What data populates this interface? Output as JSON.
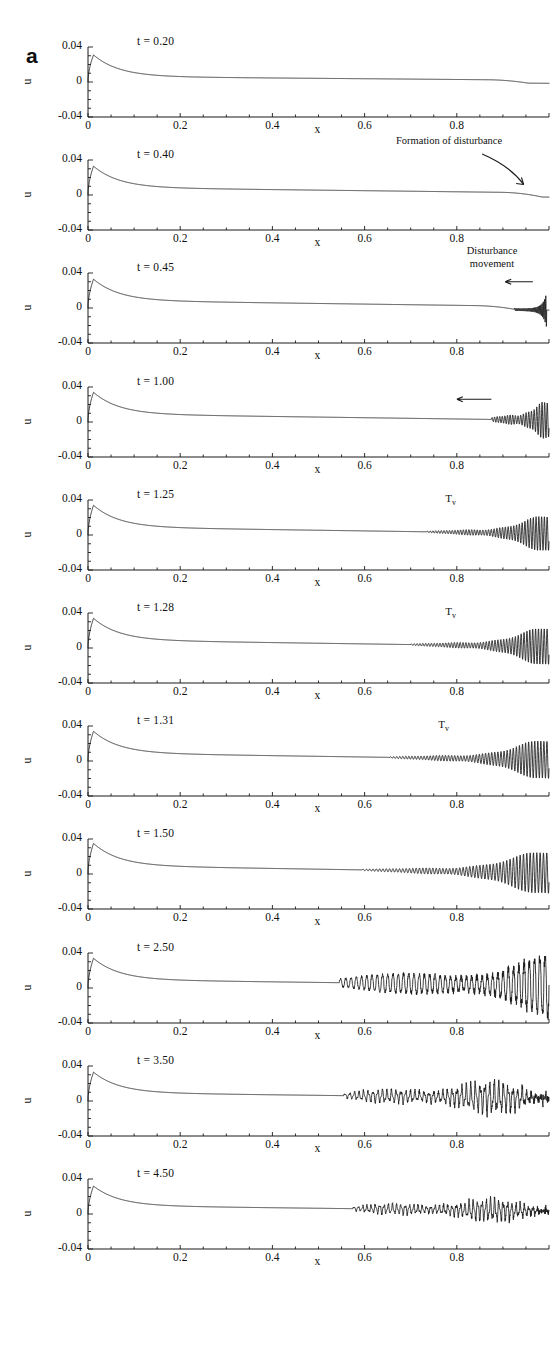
{
  "figure": {
    "panel_letter": "a",
    "y_axis_name": "u",
    "x_axis_name": "x",
    "y_ticks": [
      "0.04",
      "0",
      "-0.04"
    ],
    "x_ticks": [
      "0",
      "0.2",
      "0.4",
      "0.6",
      "0.8"
    ],
    "ink_color": "#1a1a1a",
    "background_color": "#ffffff"
  },
  "annotations": {
    "formation": "Formation of disturbance",
    "movement_line1": "Disturbance",
    "movement_line2": "movement",
    "tv_symbol": "T",
    "tv_subscript": "v"
  },
  "chart_data": {
    "type": "line",
    "title": "a",
    "xlabel": "x",
    "ylabel": "u",
    "xlim": [
      0,
      1
    ],
    "ylim": [
      -0.04,
      0.04
    ],
    "xticks": [
      0,
      0.2,
      0.4,
      0.6,
      0.8
    ],
    "yticks": [
      -0.04,
      0,
      0.04
    ],
    "grid": false,
    "legend": "none",
    "panels": [
      {
        "label": "t = 0.20",
        "t": 0.2,
        "spike_peak": 0.031,
        "plateau_start": 0.0062,
        "plateau_end": 0.002,
        "tail_dip": -0.0035,
        "tail_dip_x": 0.955,
        "osc_start": null,
        "osc_end": null,
        "osc_amp_start": 0,
        "osc_amp_end": 0,
        "osc_cycles": 0,
        "osc_kind": "none",
        "annotation": null,
        "tv_label": false,
        "tv_x": null,
        "arrow": null
      },
      {
        "label": "t = 0.40",
        "t": 0.4,
        "spike_peak": 0.033,
        "plateau_start": 0.0085,
        "plateau_end": 0.0024,
        "tail_dip": -0.0048,
        "tail_dip_x": 0.985,
        "osc_start": null,
        "osc_end": null,
        "osc_amp_start": 0,
        "osc_amp_end": 0,
        "osc_cycles": 0,
        "osc_kind": "none",
        "annotation": "formation",
        "tv_label": false,
        "tv_x": null,
        "arrow": null
      },
      {
        "label": "t = 0.45",
        "t": 0.45,
        "spike_peak": 0.033,
        "plateau_start": 0.0085,
        "plateau_end": 0.0016,
        "tail_dip": -0.004,
        "tail_dip_x": 0.93,
        "osc_start": 0.925,
        "osc_end": 0.995,
        "osc_amp_start": 0.0015,
        "osc_amp_end": 0.021,
        "osc_cycles": 26,
        "osc_kind": "burst",
        "annotation": "movement",
        "tv_label": false,
        "tv_x": null,
        "arrow": {
          "type": "left",
          "x1": 0.905,
          "x2": 0.965,
          "y": 0.03
        }
      },
      {
        "label": "t = 1.00",
        "t": 1.0,
        "spike_peak": 0.034,
        "plateau_start": 0.009,
        "plateau_end": 0.002,
        "tail_dip": 0,
        "tail_dip_x": null,
        "osc_start": 0.875,
        "osc_end": 1.0,
        "osc_amp_start": 0.002,
        "osc_amp_end": 0.02,
        "osc_cycles": 22,
        "osc_kind": "grow",
        "annotation": null,
        "tv_label": false,
        "tv_x": null,
        "arrow": {
          "type": "left",
          "x1": 0.8,
          "x2": 0.875,
          "y": 0.026
        }
      },
      {
        "label": "t = 1.25",
        "t": 1.25,
        "spike_peak": 0.034,
        "plateau_start": 0.009,
        "plateau_end": 0.0016,
        "tail_dip": 0,
        "tail_dip_x": null,
        "osc_start": 0.735,
        "osc_end": 1.0,
        "osc_amp_start": 0.0008,
        "osc_amp_end": 0.02,
        "osc_cycles": 44,
        "osc_kind": "grow",
        "annotation": null,
        "tv_label": true,
        "tv_x": 0.775,
        "arrow": null
      },
      {
        "label": "t = 1.28",
        "t": 1.28,
        "spike_peak": 0.034,
        "plateau_start": 0.009,
        "plateau_end": 0.0016,
        "tail_dip": 0,
        "tail_dip_x": null,
        "osc_start": 0.7,
        "osc_end": 1.0,
        "osc_amp_start": 0.0008,
        "osc_amp_end": 0.021,
        "osc_cycles": 48,
        "osc_kind": "grow",
        "annotation": null,
        "tv_label": true,
        "tv_x": 0.775,
        "arrow": null
      },
      {
        "label": "t = 1.31",
        "t": 1.31,
        "spike_peak": 0.034,
        "plateau_start": 0.009,
        "plateau_end": 0.0014,
        "tail_dip": 0,
        "tail_dip_x": null,
        "osc_start": 0.655,
        "osc_end": 1.0,
        "osc_amp_start": 0.0008,
        "osc_amp_end": 0.022,
        "osc_cycles": 52,
        "osc_kind": "grow",
        "annotation": null,
        "tv_label": true,
        "tv_x": 0.76,
        "arrow": null
      },
      {
        "label": "t = 1.50",
        "t": 1.5,
        "spike_peak": 0.035,
        "plateau_start": 0.0095,
        "plateau_end": 0.0012,
        "tail_dip": 0,
        "tail_dip_x": null,
        "osc_start": 0.595,
        "osc_end": 1.0,
        "osc_amp_start": 0.0008,
        "osc_amp_end": 0.024,
        "osc_cycles": 56,
        "osc_kind": "grow",
        "annotation": null,
        "tv_label": false,
        "tv_x": null,
        "arrow": null
      },
      {
        "label": "t = 2.50",
        "t": 2.5,
        "spike_peak": 0.034,
        "plateau_start": 0.0095,
        "plateau_end": 0.003,
        "tail_dip": 0,
        "tail_dip_x": null,
        "osc_start": 0.545,
        "osc_end": 1.0,
        "osc_amp_start": 0.004,
        "osc_amp_end": 0.026,
        "osc_cycles": 40,
        "osc_kind": "sawtooth",
        "annotation": null,
        "tv_label": false,
        "tv_x": null,
        "arrow": null
      },
      {
        "label": "t = 3.50",
        "t": 3.5,
        "spike_peak": 0.033,
        "plateau_start": 0.0095,
        "plateau_end": 0.0032,
        "tail_dip": 0,
        "tail_dip_x": null,
        "osc_start": 0.555,
        "osc_end": 1.0,
        "osc_amp_start": 0.003,
        "osc_amp_end": 0.02,
        "osc_cycles": 44,
        "osc_kind": "irregular",
        "annotation": null,
        "tv_label": false,
        "tv_x": null,
        "arrow": null
      },
      {
        "label": "t = 4.50",
        "t": 4.5,
        "spike_peak": 0.032,
        "plateau_start": 0.0095,
        "plateau_end": 0.0034,
        "tail_dip": 0,
        "tail_dip_x": null,
        "osc_start": 0.575,
        "osc_end": 1.0,
        "osc_amp_start": 0.0025,
        "osc_amp_end": 0.013,
        "osc_cycles": 46,
        "osc_kind": "irregular",
        "annotation": null,
        "tv_label": false,
        "tv_x": null,
        "arrow": null
      }
    ]
  }
}
